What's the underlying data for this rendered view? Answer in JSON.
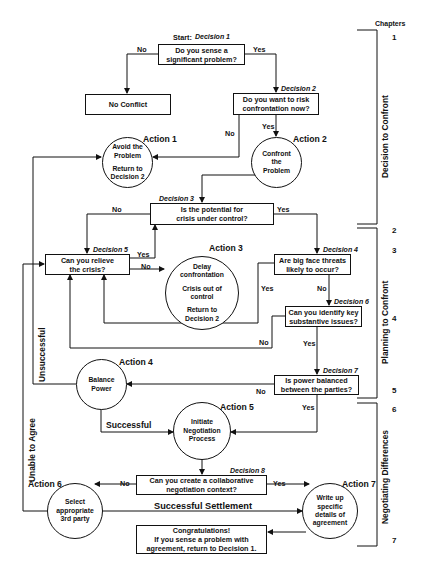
{
  "chapters": {
    "header": "Chapters",
    "numbers": [
      "1",
      "2",
      "3",
      "4",
      "5",
      "6",
      "7"
    ],
    "phases": [
      "Decision to Confront",
      "Planning to Confront",
      "Negotiating Differences"
    ]
  },
  "decisions": {
    "d1": {
      "tag": "Start:",
      "label": "Decision 1",
      "text": [
        "Do you sense a",
        "significant problem?"
      ]
    },
    "d2": {
      "label": "Decision 2",
      "text": [
        "Do you want to risk",
        "confrontation now?"
      ]
    },
    "d3": {
      "label": "Decision 3",
      "text": [
        "Is the potential for",
        "crisis under control?"
      ]
    },
    "d4": {
      "label": "Decision 4",
      "text": [
        "Are big face threats",
        "likely to occur?"
      ]
    },
    "d5": {
      "label": "Decision 5",
      "text": [
        "Can you relieve",
        "the crisis?"
      ]
    },
    "d6": {
      "label": "Decision 6",
      "text": [
        "Can you identify key",
        "substantive issues?"
      ]
    },
    "d7": {
      "label": "Decision 7",
      "text": [
        "Is power balanced",
        "between the parties?"
      ]
    },
    "d8": {
      "label": "Decision 8",
      "text": [
        "Can you create a collaborative",
        "negotiation context?"
      ]
    }
  },
  "actions": {
    "a1": {
      "label": "Action 1",
      "text": [
        "Avoid the",
        "Problem",
        "",
        "Return to",
        "Decision 2"
      ]
    },
    "a2": {
      "label": "Action 2",
      "text": [
        "Confront",
        "the",
        "Problem"
      ]
    },
    "a3": {
      "label": "Action 3",
      "text": [
        "Delay",
        "confrontation",
        "",
        "Crisis out of",
        "control",
        "",
        "Return to",
        "Decision 2"
      ]
    },
    "a4": {
      "label": "Action 4",
      "text": [
        "Balance",
        "Power"
      ]
    },
    "a5": {
      "label": "Action 5",
      "text": [
        "Initiate",
        "Negotiation",
        "Process"
      ]
    },
    "a6": {
      "label": "Action 6",
      "text": [
        "Select",
        "appropriate",
        "3rd party"
      ]
    },
    "a7": {
      "label": "Action 7",
      "text": [
        "Write up",
        "specific",
        "details of",
        "agreement"
      ]
    }
  },
  "terminals": {
    "no_conflict": "No Conflict",
    "congrats": [
      "Congratulations!",
      "If you sense a problem with",
      "agreement, return to Decision 1."
    ]
  },
  "edge_labels": {
    "yes": "Yes",
    "no": "No",
    "successful": "Successful",
    "unsuccessful": "Unsuccessful",
    "unable_to_agree": "Unable to Agree",
    "successful_settlement": "Successful Settlement"
  }
}
